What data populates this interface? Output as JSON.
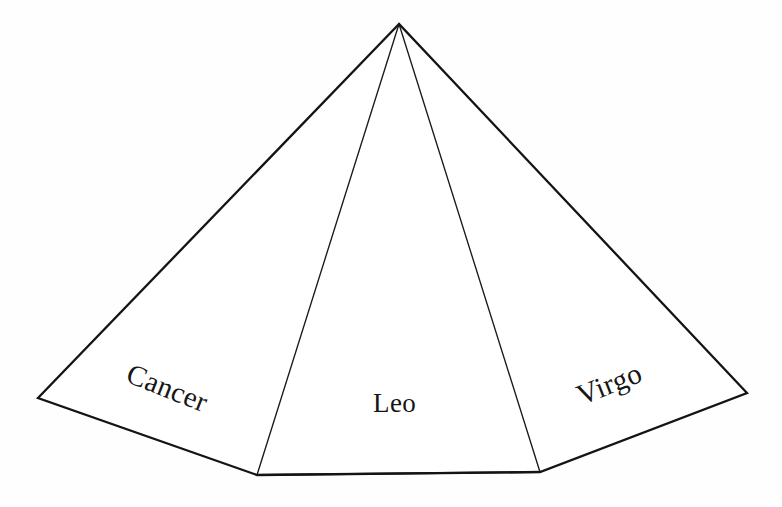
{
  "figure": {
    "background_color": "#fefefe",
    "stroke_color": "#141414",
    "width": 782,
    "height": 507
  },
  "labels": {
    "left_face": "Cancer",
    "center_face": "Leo",
    "right_face": "Virgo"
  },
  "geometry": {
    "apex": {
      "x": 399,
      "y": 24
    },
    "left_corner": {
      "x": 38,
      "y": 398
    },
    "bottom_left_vertex": {
      "x": 257,
      "y": 475
    },
    "bottom_right_vertex": {
      "x": 540,
      "y": 472
    },
    "right_corner": {
      "x": 747,
      "y": 393
    },
    "outline_path": "M 399 24 L 38 398 L 257 475 L 540 472 L 747 393 Z",
    "inner_edge_left": "M 399 24 L 257 475",
    "inner_edge_right": "M 399 24 L 540 472"
  },
  "chart_data": {
    "type": "diagram",
    "faces": [
      {
        "name": "Cancer",
        "position": "left",
        "label_rotation_deg": 21.5
      },
      {
        "name": "Leo",
        "position": "center",
        "label_rotation_deg": 0
      },
      {
        "name": "Virgo",
        "position": "right",
        "label_rotation_deg": -21.5
      }
    ],
    "vertices": [
      {
        "name": "apex",
        "x": 399,
        "y": 24
      },
      {
        "name": "left-corner",
        "x": 38,
        "y": 398
      },
      {
        "name": "bottom-left",
        "x": 257,
        "y": 475
      },
      {
        "name": "bottom-right",
        "x": 540,
        "y": 472
      },
      {
        "name": "right-corner",
        "x": 747,
        "y": 393
      }
    ],
    "edges": [
      {
        "from": "apex",
        "to": "left-corner",
        "weight": "thick"
      },
      {
        "from": "left-corner",
        "to": "bottom-left",
        "weight": "thick"
      },
      {
        "from": "bottom-left",
        "to": "bottom-right",
        "weight": "thick"
      },
      {
        "from": "bottom-right",
        "to": "right-corner",
        "weight": "thick"
      },
      {
        "from": "right-corner",
        "to": "apex",
        "weight": "thick"
      },
      {
        "from": "apex",
        "to": "bottom-left",
        "weight": "thin"
      },
      {
        "from": "apex",
        "to": "bottom-right",
        "weight": "thin"
      }
    ],
    "grid": false,
    "legend": null
  }
}
